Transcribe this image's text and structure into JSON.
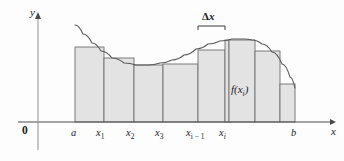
{
  "figure": {
    "background": "#fdfdfd",
    "axis_color": "#4a4a4a",
    "curve_color": "#5a5a5a",
    "rect_fill": "#e3e3e3",
    "rect_stroke": "#6e6e6e"
  },
  "axes": {
    "y_label": "y",
    "x_label": "x",
    "origin_label": "0",
    "x_axis_y": 122,
    "y_axis_x": 38,
    "x_axis_start": 18,
    "x_axis_end": 330,
    "y_axis_top": 14,
    "y_axis_bottom": 150
  },
  "ticks": [
    {
      "name": "a",
      "text": "a",
      "sub": "",
      "x": 75,
      "label_x": 71,
      "label_y": 128
    },
    {
      "name": "x1",
      "text": "x",
      "sub": "1",
      "x": 104,
      "label_x": 96,
      "label_y": 128
    },
    {
      "name": "x2",
      "text": "x",
      "sub": "2",
      "x": 134,
      "label_x": 126,
      "label_y": 128
    },
    {
      "name": "x3",
      "text": "x",
      "sub": "3",
      "x": 163,
      "label_x": 155,
      "label_y": 128
    },
    {
      "name": "xi-1",
      "text": "x",
      "sub": "i − 1",
      "x": 198,
      "label_x": 186,
      "label_y": 128
    },
    {
      "name": "xi",
      "text": "x",
      "sub": "i",
      "x": 225,
      "label_x": 219,
      "label_y": 128
    },
    {
      "name": "b",
      "text": "b",
      "sub": "",
      "x": 295,
      "label_x": 291,
      "label_y": 128
    }
  ],
  "annotations": {
    "delta_x": {
      "label_prefix": "Δ",
      "label_var": "x",
      "label_x": 198,
      "label_y": 11,
      "bracket_left": 198,
      "bracket_right": 225,
      "bracket_y": 26,
      "bracket_tick": 4
    },
    "f_xi": {
      "text": "f(x",
      "sub": "i",
      "suffix": ")",
      "label_x": 231,
      "label_y": 84
    }
  },
  "chart_data": {
    "type": "area",
    "xlabel": "x",
    "ylabel": "y",
    "grid": false,
    "legend": null,
    "baseline_y": 122,
    "rectangles": [
      {
        "index": 1,
        "x_left": 75,
        "x_right": 104,
        "top_y": 47,
        "width": 29,
        "height": 75
      },
      {
        "index": 2,
        "x_left": 104,
        "x_right": 134,
        "top_y": 58,
        "width": 30,
        "height": 64
      },
      {
        "index": 3,
        "x_left": 134,
        "x_right": 163,
        "top_y": 65,
        "width": 29,
        "height": 57
      },
      {
        "index": 4,
        "x_left": 163,
        "x_right": 198,
        "top_y": 64,
        "width": 35,
        "height": 58
      },
      {
        "index": 5,
        "x_left": 198,
        "x_right": 225,
        "top_y": 50,
        "width": 27,
        "height": 72
      },
      {
        "index": 6,
        "x_left": 225,
        "x_right": 229,
        "top_y": 40,
        "width": 4,
        "height": 82
      },
      {
        "index": 7,
        "x_left": 229,
        "x_right": 255,
        "top_y": 40,
        "width": 26,
        "height": 82
      },
      {
        "index": 8,
        "x_left": 255,
        "x_right": 280,
        "top_y": 51,
        "width": 25,
        "height": 71
      },
      {
        "index": 9,
        "x_left": 280,
        "x_right": 295,
        "top_y": 84,
        "width": 15,
        "height": 38
      }
    ],
    "curve_points": [
      [
        75,
        25
      ],
      [
        83,
        34
      ],
      [
        92,
        43
      ],
      [
        101,
        51
      ],
      [
        112,
        58
      ],
      [
        124,
        63
      ],
      [
        136,
        65
      ],
      [
        148,
        65
      ],
      [
        160,
        63
      ],
      [
        172,
        60
      ],
      [
        184,
        55
      ],
      [
        196,
        49
      ],
      [
        208,
        44
      ],
      [
        220,
        41
      ],
      [
        232,
        39
      ],
      [
        244,
        39
      ],
      [
        252,
        40
      ],
      [
        262,
        44
      ],
      [
        272,
        52
      ],
      [
        282,
        64
      ],
      [
        290,
        77
      ],
      [
        295,
        88
      ]
    ]
  }
}
